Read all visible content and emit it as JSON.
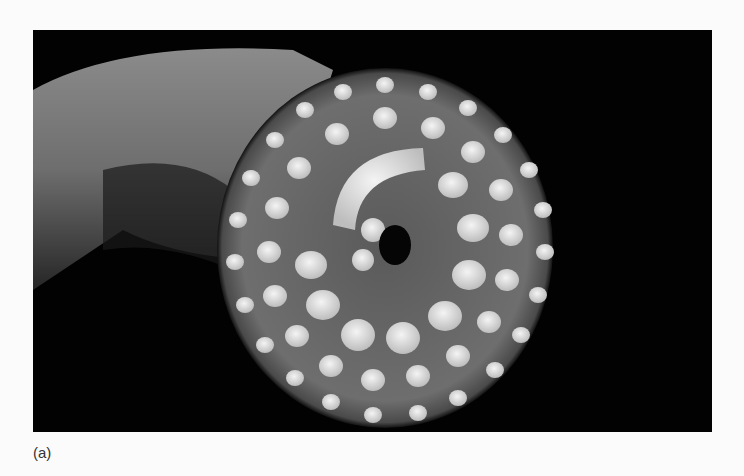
{
  "figure": {
    "panel_label": "(a)",
    "colors": {
      "background": "#020202",
      "page": "#fbfbfb",
      "tooth": "#e8e8e8",
      "disc": "#6a6a6a",
      "body": "#8a8a8a"
    }
  }
}
